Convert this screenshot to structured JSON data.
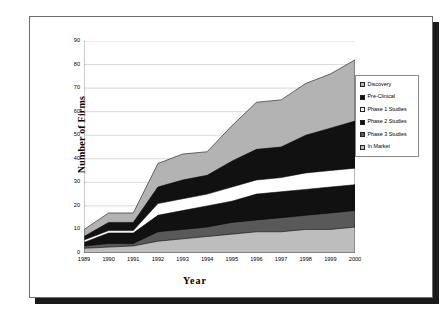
{
  "chart_data": {
    "type": "area",
    "stacked": true,
    "title": "",
    "xlabel": "Year",
    "ylabel": "Number of Firms",
    "categories": [
      "1989",
      "1990",
      "1991",
      "1992",
      "1993",
      "1994",
      "1995",
      "1996",
      "1997",
      "1998",
      "1999",
      "2000"
    ],
    "x": [
      1989,
      1990,
      1991,
      1992,
      1993,
      1994,
      1995,
      1996,
      1997,
      1998,
      1999,
      2000
    ],
    "ylim": [
      0,
      90
    ],
    "yticks": [
      0,
      10,
      20,
      30,
      40,
      50,
      60,
      70,
      80,
      90
    ],
    "grid": true,
    "legend_position": "right",
    "series": [
      {
        "name": "Discovery",
        "color": "#b3b3b3",
        "values": [
          10,
          17,
          17,
          38,
          42,
          43,
          54,
          64,
          65,
          72,
          76,
          82
        ]
      },
      {
        "name": "Pre-Clinical",
        "color": "#111111",
        "values": [
          7,
          13,
          13,
          28,
          31,
          33,
          39,
          44,
          45,
          50,
          53,
          56
        ]
      },
      {
        "name": "Phase 1 Studies",
        "color": "#ffffff",
        "values": [
          5.5,
          9.5,
          9.5,
          21,
          23,
          25,
          28,
          31,
          32,
          34,
          35,
          36
        ]
      },
      {
        "name": "Phase 2 Studies",
        "color": "#111111",
        "values": [
          4.5,
          8.5,
          8.5,
          16,
          18,
          20,
          22,
          25,
          26,
          27,
          28,
          29
        ]
      },
      {
        "name": "Phase 3 Studies",
        "color": "#595959",
        "values": [
          3,
          4,
          4,
          9,
          10,
          11,
          13,
          14,
          15,
          16,
          17,
          18
        ]
      },
      {
        "name": "In Market",
        "color": "#bdbdbd",
        "values": [
          2,
          2.5,
          3,
          5,
          6,
          7,
          8,
          9,
          9,
          10,
          10,
          11
        ]
      }
    ]
  },
  "axes": {
    "y_title": "Number of Firms",
    "x_title": "Year",
    "y_tick_labels": [
      "90",
      "80",
      "70",
      "60",
      "50",
      "40",
      "30",
      "20",
      "10",
      "0"
    ],
    "x_tick_labels": [
      "1989",
      "1990",
      "1991",
      "1992",
      "1993",
      "1994",
      "1995",
      "1996",
      "1997",
      "1998",
      "1999",
      "2000"
    ]
  },
  "legend": {
    "items": [
      {
        "label": "Discovery",
        "color": "#b3b3b3"
      },
      {
        "label": "Pre-Clinical",
        "color": "#111111"
      },
      {
        "label": "Phase 1 Studies",
        "color": "#ffffff"
      },
      {
        "label": "Phase 2 Studies",
        "color": "#111111"
      },
      {
        "label": "Phase 3 Studies",
        "color": "#595959"
      },
      {
        "label": "In Market",
        "color": "#bdbdbd"
      }
    ]
  },
  "style": {
    "grid_color": "#c8c8c8",
    "axis_color": "#7a7a7a",
    "frame_color": "#6d6d6d",
    "shadow_color": "#1a1a1a",
    "background": "#ffffff"
  }
}
